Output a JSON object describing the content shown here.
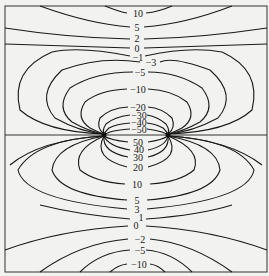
{
  "diagram": {
    "type": "contour_plot",
    "upper_labels": [
      "10",
      "5",
      "2",
      "0",
      "-1",
      "-3",
      "-5",
      "-10",
      "-20",
      "-30",
      "-40",
      "-50"
    ],
    "lower_labels": [
      "50",
      "40",
      "30",
      "20",
      "10",
      "5",
      "3",
      "1",
      "0",
      "-2",
      "-5",
      "-10"
    ]
  }
}
